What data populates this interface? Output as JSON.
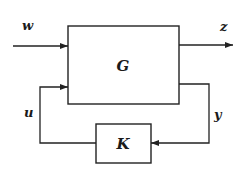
{
  "diagram": {
    "type": "block-diagram",
    "blocks": [
      {
        "id": "G",
        "label": "G"
      },
      {
        "id": "K",
        "label": "K"
      }
    ],
    "signals": [
      {
        "id": "w",
        "label": "w",
        "from": "external",
        "to": "G"
      },
      {
        "id": "z",
        "label": "z",
        "from": "G",
        "to": "external"
      },
      {
        "id": "y",
        "label": "y",
        "from": "G",
        "to": "K"
      },
      {
        "id": "u",
        "label": "u",
        "from": "K",
        "to": "G"
      }
    ]
  },
  "labels": {
    "G": "G",
    "K": "K",
    "w": "w",
    "z": "z",
    "y": "y",
    "u": "u"
  }
}
